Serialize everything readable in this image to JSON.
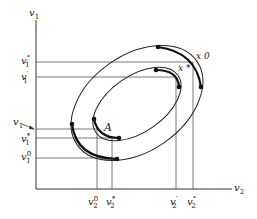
{
  "diagram": {
    "axes": {
      "x_label": "v",
      "x_sub": "2",
      "y_label": "v",
      "y_sub": "1"
    },
    "y_ticks": [
      {
        "id": "v1-deg",
        "base": "v",
        "sub": "1",
        "sup": "°"
      },
      {
        "id": "v1-prime",
        "base": "v",
        "sub": "1",
        "sup": "′"
      },
      {
        "id": "v1-arrow",
        "base": "v",
        "sub": "1",
        "sup": ""
      },
      {
        "id": "v1-star",
        "base": "v",
        "sub": "1",
        "sup": "*"
      },
      {
        "id": "v1-zero",
        "base": "v",
        "sub": "1",
        "sup": "0"
      }
    ],
    "x_ticks": [
      {
        "id": "v2-zero",
        "base": "v",
        "sub": "2",
        "sup": "0"
      },
      {
        "id": "v2-star",
        "base": "v",
        "sub": "2",
        "sup": "*"
      },
      {
        "id": "v2-prime",
        "base": "v",
        "sub": "2",
        "sup": "′"
      },
      {
        "id": "v2-deg",
        "base": "v",
        "sub": "2",
        "sup": "°"
      }
    ],
    "points": {
      "A": "A",
      "x0": "x 0",
      "xstar": "x *"
    },
    "colors": {
      "ink": "#222222",
      "guide": "#555555"
    }
  }
}
